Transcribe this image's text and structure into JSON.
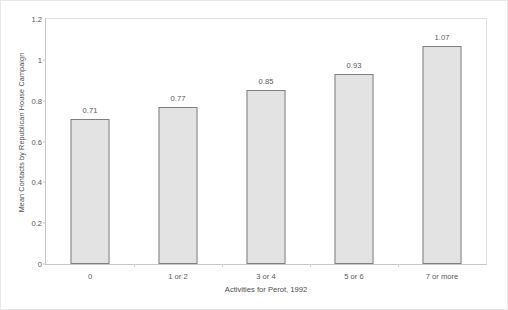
{
  "chart_data": {
    "type": "bar",
    "title": "",
    "subtitle": "",
    "xlabel": "Activities for Perot, 1992",
    "ylabel": "Mean Contacts by Republican House Campaign",
    "categories": [
      "0",
      "1 or 2",
      "3 or 4",
      "5 or 6",
      "7 or more"
    ],
    "values": [
      0.71,
      0.77,
      0.85,
      0.93,
      1.07
    ],
    "value_labels": [
      "0.71",
      "0.77",
      "0.85",
      "0.93",
      "1.07"
    ],
    "ylim": [
      0,
      1.2
    ],
    "ytick_labels": [
      "1.2",
      "1",
      "0.8",
      "0.6",
      "0.4",
      "0.2",
      "0"
    ],
    "ytick_values": [
      1.2,
      1,
      0.8,
      0.6,
      0.4,
      0.2,
      0
    ],
    "grid": false,
    "legend": "none",
    "colors": {
      "bar_fill": "#e3e3e3",
      "bar_border": "#7f7f7f",
      "axis": "#c8c8c8",
      "text": "#59595b",
      "plot_border": "#e0e0e0",
      "background": "#ffffff"
    }
  }
}
